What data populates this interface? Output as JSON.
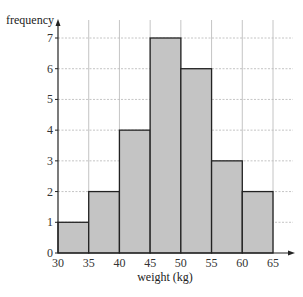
{
  "chart_data": {
    "type": "bar",
    "subtype": "histogram",
    "title": "",
    "xlabel": "weight (kg)",
    "ylabel": "frequency",
    "bins": [
      [
        30,
        35
      ],
      [
        35,
        40
      ],
      [
        40,
        45
      ],
      [
        45,
        50
      ],
      [
        50,
        55
      ],
      [
        55,
        60
      ],
      [
        60,
        65
      ]
    ],
    "categories": [
      "30-35",
      "35-40",
      "40-45",
      "45-50",
      "50-55",
      "55-60",
      "60-65"
    ],
    "values": [
      1,
      2,
      4,
      7,
      6,
      3,
      2
    ],
    "x_ticks": [
      30,
      35,
      40,
      45,
      50,
      55,
      60,
      65
    ],
    "y_ticks": [
      0,
      1,
      2,
      3,
      4,
      5,
      6,
      7
    ],
    "xlim": [
      30,
      65
    ],
    "ylim": [
      0,
      7
    ],
    "grid": true,
    "legend": null
  },
  "colors": {
    "bar_fill": "#c4c4c4",
    "bar_stroke": "#222222",
    "grid": "#b5b5b5",
    "axis": "#222222"
  }
}
